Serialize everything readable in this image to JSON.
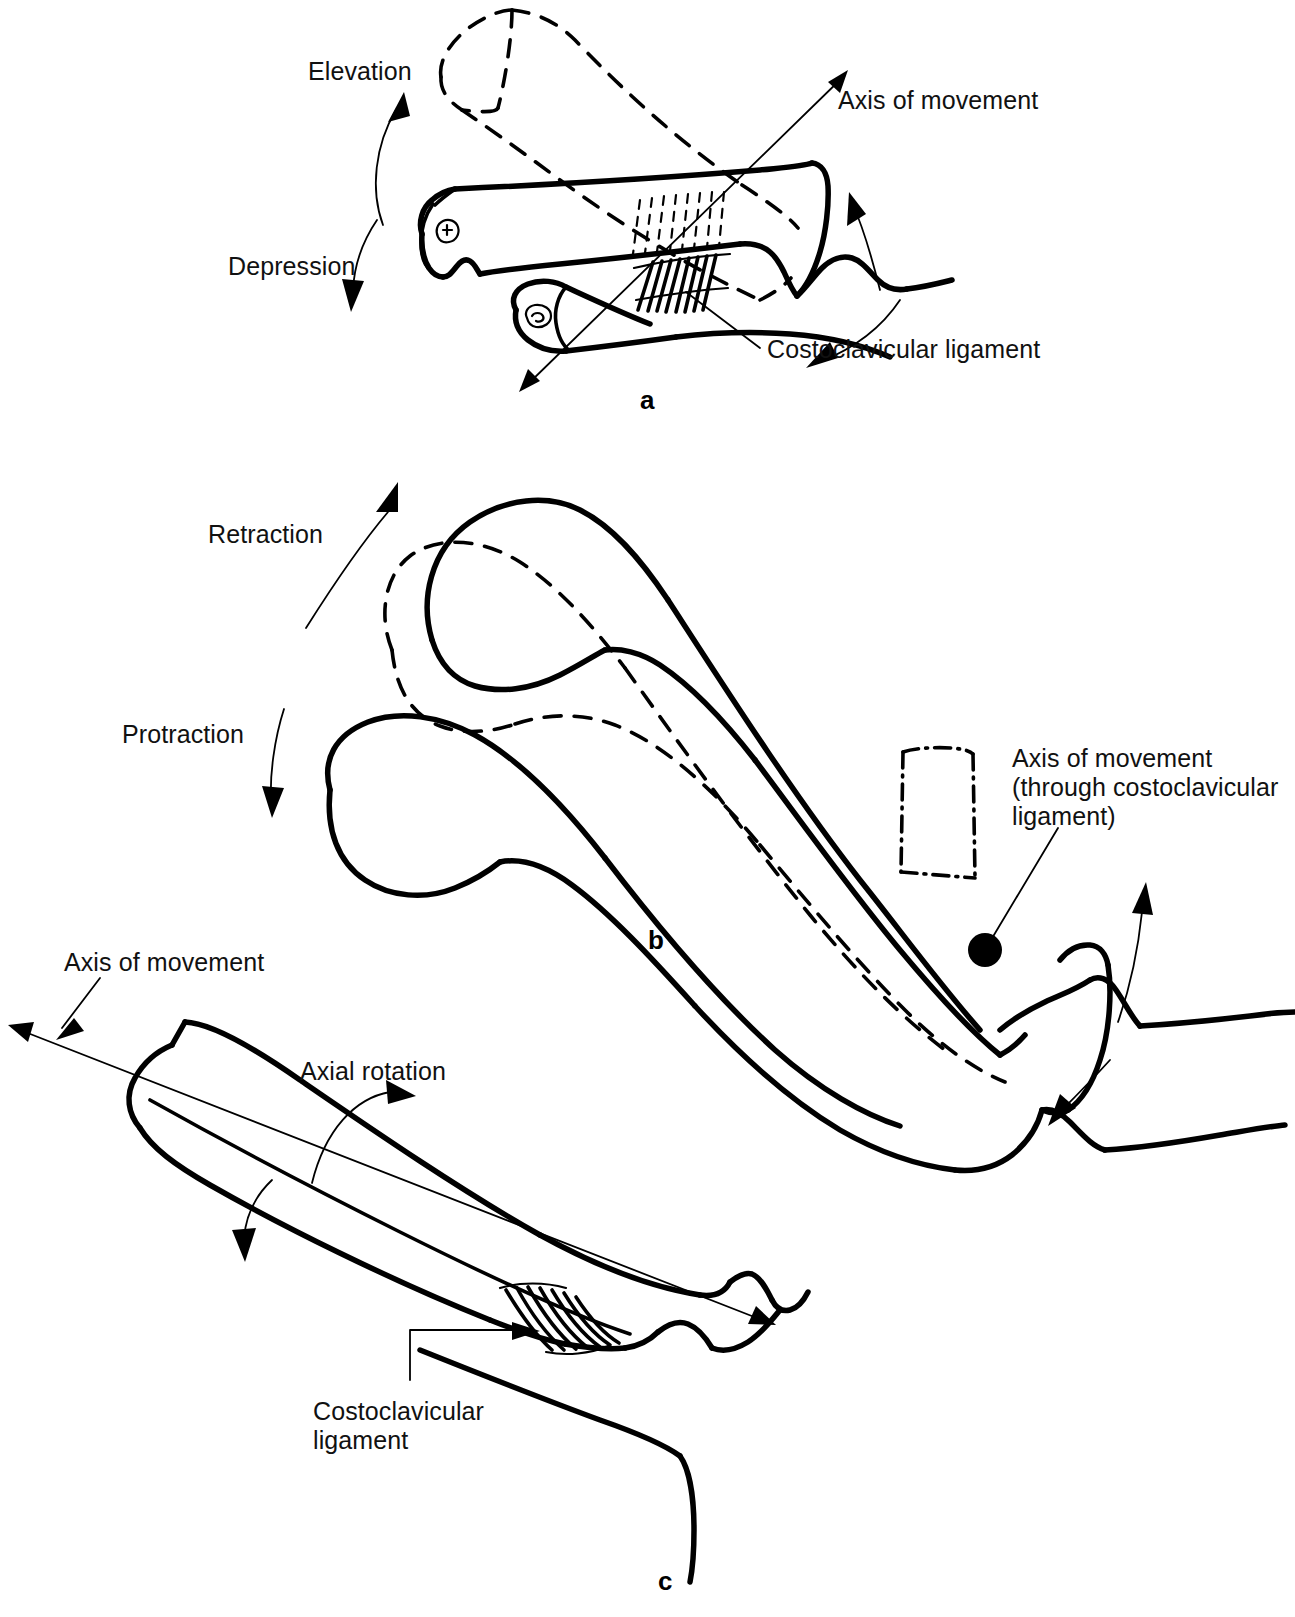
{
  "figure": {
    "title_semantic": "sternoclavicular-joint-movements",
    "background": "#ffffff",
    "ink": "#000000"
  },
  "panels": [
    {
      "id": "a",
      "letter": "a",
      "description": "Elevation and depression of the clavicle about an anteroposterior axis through the costoclavicular ligament",
      "labels": [
        {
          "name": "elevation-label",
          "text": "Elevation"
        },
        {
          "name": "depression-label",
          "text": "Depression"
        },
        {
          "name": "axis-of-movement-label",
          "text": "Axis of movement"
        },
        {
          "name": "costoclavicular-ligament-label",
          "text": "Costoclavicular ligament"
        }
      ]
    },
    {
      "id": "b",
      "letter": "b",
      "description": "Protraction and retraction of the clavicle about a vertical axis through the costoclavicular ligament",
      "labels": [
        {
          "name": "retraction-label",
          "text": "Retraction"
        },
        {
          "name": "protraction-label",
          "text": "Protraction"
        },
        {
          "name": "axis-of-movement-through-ligament-label",
          "text": "Axis of movement\n(through costoclavicular\nligament)"
        }
      ]
    },
    {
      "id": "c",
      "letter": "c",
      "description": "Axial rotation of the clavicle about its long axis",
      "labels": [
        {
          "name": "axis-of-movement-label",
          "text": "Axis of movement"
        },
        {
          "name": "axial-rotation-label",
          "text": "Axial rotation"
        },
        {
          "name": "costoclavicular-ligament-label",
          "text": "Costoclavicular\nligament"
        }
      ]
    }
  ],
  "panel_a": {
    "elevation": "Elevation",
    "depression": "Depression",
    "axis_of_movement": "Axis of movement",
    "costoclavicular_ligament": "Costoclavicular ligament",
    "letter": "a"
  },
  "panel_b": {
    "retraction": "Retraction",
    "protraction": "Protraction",
    "axis_line1": "Axis of movement",
    "axis_line2": "(through costoclavicular",
    "axis_line3": "ligament)",
    "letter": "b"
  },
  "panel_c": {
    "axis_of_movement": "Axis of movement",
    "axial_rotation": "Axial rotation",
    "ligament_line1": "Costoclavicular",
    "ligament_line2": "ligament",
    "letter": "c"
  }
}
